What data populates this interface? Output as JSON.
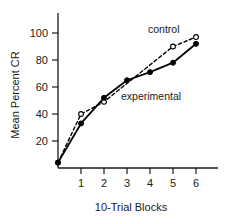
{
  "chart_data": {
    "type": "line",
    "title": "",
    "xlabel": "10-Trial Blocks",
    "ylabel": "Mean Percent CR",
    "xlim": [
      -0.35,
      6.6
    ],
    "ylim": [
      0,
      112
    ],
    "xticks": [
      1,
      2,
      3,
      4,
      5,
      6
    ],
    "yticks": [
      20,
      40,
      60,
      80,
      100
    ],
    "grid": false,
    "legend_position": "inline-annotations",
    "series": [
      {
        "name": "experimental",
        "marker": "filled-circle",
        "linestyle": "solid",
        "color": "#000000",
        "x": [
          0,
          1,
          2,
          3,
          4,
          5,
          6
        ],
        "values": [
          4,
          33,
          52,
          65,
          71,
          78,
          92
        ]
      },
      {
        "name": "control",
        "marker": "open-circle",
        "linestyle": "dashed",
        "color": "#000000",
        "x": [
          0,
          1,
          2,
          5,
          6
        ],
        "values": [
          4,
          40,
          49,
          90,
          97
        ]
      }
    ],
    "annotations": [
      {
        "text": "control",
        "x": 4.3,
        "y": 104
      },
      {
        "text": "experimental",
        "x": 3.05,
        "y": 60
      }
    ]
  },
  "axes": {
    "y_label": "Mean Percent CR",
    "x_label": "10-Trial Blocks",
    "y_tick_labels": [
      "100",
      "80",
      "60",
      "40",
      "20"
    ],
    "x_tick_labels": [
      "1",
      "2",
      "3",
      "4",
      "5",
      "6"
    ]
  },
  "labels": {
    "control": "control",
    "experimental": "experimental"
  },
  "colors": {
    "ink": "#1a1a1a",
    "line": "#000000",
    "background": "#ffffff"
  }
}
